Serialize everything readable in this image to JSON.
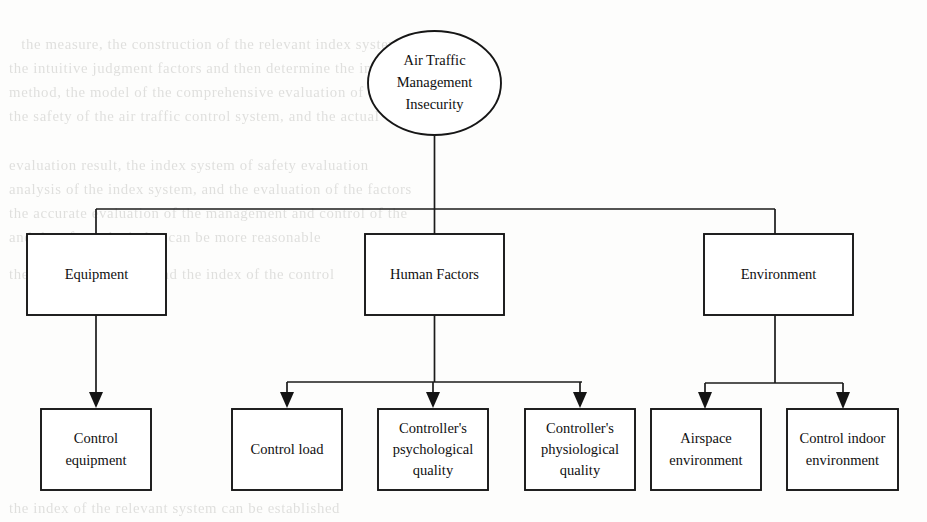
{
  "document": {
    "type": "hierarchical-tree-diagram",
    "background_note": "faint bleed-through text from reverse page"
  },
  "diagram": {
    "root": {
      "id": "root",
      "shape": "ellipse",
      "lines": [
        "Air Traffic",
        "Management",
        "Insecurity"
      ]
    },
    "level1": [
      {
        "id": "equipment",
        "shape": "rectangle",
        "lines": [
          "Equipment"
        ]
      },
      {
        "id": "human-factors",
        "shape": "rectangle",
        "lines": [
          "Human Factors"
        ]
      },
      {
        "id": "environment",
        "shape": "rectangle",
        "lines": [
          "Environment"
        ]
      }
    ],
    "level2": [
      {
        "id": "control-equipment",
        "parent": "equipment",
        "shape": "rectangle",
        "lines": [
          "Control",
          "equipment"
        ]
      },
      {
        "id": "control-load",
        "parent": "human-factors",
        "shape": "rectangle",
        "lines": [
          "Control load"
        ]
      },
      {
        "id": "controller-psychological-quality",
        "parent": "human-factors",
        "shape": "rectangle",
        "lines": [
          "Controller's",
          "psychological",
          "quality"
        ]
      },
      {
        "id": "controller-physiological-quality",
        "parent": "human-factors",
        "shape": "rectangle",
        "lines": [
          "Controller's",
          "physiological",
          "quality"
        ]
      },
      {
        "id": "airspace-environment",
        "parent": "environment",
        "shape": "rectangle",
        "lines": [
          "Airspace",
          "environment"
        ]
      },
      {
        "id": "control-indoor-environment",
        "parent": "environment",
        "shape": "rectangle",
        "lines": [
          "Control indoor",
          "environment"
        ]
      }
    ]
  },
  "colors": {
    "page_background": "#fdfdfc",
    "stroke": "#161616",
    "node_fill": "#ffffff",
    "text": "#101010",
    "ghost_text": "rgba(120,118,112,0.22)"
  },
  "background_text": {
    "top": [
      "the measure, the construction of the relevant index system is",
      "the intuitive judgment factors and then determine the index of the",
      "method, the model of the comprehensive evaluation of the safety",
      "the safety of the air traffic control system, and the actual",
      "evaluation result, the index system of safety evaluation",
      "analysis of the index system, and the evaluation of the factors",
      "the accurate evaluation of the management and control of the",
      "and therefore, the index can be more reasonable"
    ],
    "bottom": [
      "the evaluation system and the index of the control",
      "the index of the relevant system can be established"
    ]
  }
}
